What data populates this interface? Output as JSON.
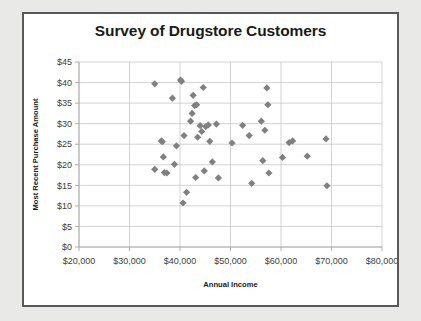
{
  "chart_data": {
    "type": "scatter",
    "title": "Survey of Drugstore Customers",
    "xlabel": "Annual Income",
    "ylabel": "Most Recent Purchase Amount",
    "xlim": [
      20000,
      80000
    ],
    "ylim": [
      0,
      45
    ],
    "xticks": [
      20000,
      30000,
      40000,
      50000,
      60000,
      70000,
      80000
    ],
    "yticks": [
      0,
      5,
      10,
      15,
      20,
      25,
      30,
      35,
      40,
      45
    ],
    "xtick_labels": [
      "$20,000",
      "$30,000",
      "$40,000",
      "$50,000",
      "$60,000",
      "$70,000",
      "$80,000"
    ],
    "ytick_labels": [
      "$0",
      "$5",
      "$10",
      "$15",
      "$20",
      "$25",
      "$30",
      "$35",
      "$40",
      "$45"
    ],
    "grid": true,
    "legend": false,
    "marker": "diamond",
    "marker_color": "#808080",
    "points": [
      [
        35000,
        39.7
      ],
      [
        35000,
        18.9
      ],
      [
        36300,
        25.8
      ],
      [
        36500,
        25.6
      ],
      [
        36700,
        21.9
      ],
      [
        36900,
        18.1
      ],
      [
        37400,
        18.0
      ],
      [
        38500,
        36.2
      ],
      [
        38900,
        20.1
      ],
      [
        39300,
        24.6
      ],
      [
        40100,
        40.6
      ],
      [
        40300,
        40.3
      ],
      [
        40600,
        10.7
      ],
      [
        40800,
        27.1
      ],
      [
        41300,
        13.3
      ],
      [
        42100,
        30.6
      ],
      [
        42400,
        32.5
      ],
      [
        42600,
        36.9
      ],
      [
        42900,
        34.4
      ],
      [
        43100,
        16.9
      ],
      [
        43300,
        34.6
      ],
      [
        43500,
        26.7
      ],
      [
        44000,
        29.5
      ],
      [
        44300,
        28.1
      ],
      [
        44600,
        38.8
      ],
      [
        44800,
        18.5
      ],
      [
        45100,
        29.3
      ],
      [
        45600,
        29.7
      ],
      [
        45900,
        25.7
      ],
      [
        46400,
        20.7
      ],
      [
        47200,
        29.9
      ],
      [
        47600,
        16.8
      ],
      [
        50300,
        25.3
      ],
      [
        52400,
        29.6
      ],
      [
        53700,
        27.1
      ],
      [
        54200,
        15.5
      ],
      [
        56100,
        30.6
      ],
      [
        56400,
        21.0
      ],
      [
        56800,
        28.4
      ],
      [
        57200,
        38.7
      ],
      [
        57400,
        34.6
      ],
      [
        57600,
        18.0
      ],
      [
        60300,
        21.8
      ],
      [
        61600,
        25.4
      ],
      [
        62300,
        25.8
      ],
      [
        65200,
        22.1
      ],
      [
        68900,
        26.3
      ],
      [
        69100,
        14.9
      ]
    ]
  }
}
